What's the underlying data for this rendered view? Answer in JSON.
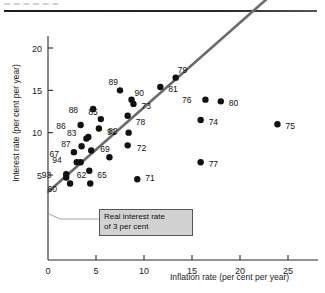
{
  "header": {
    "faint_text": "▬ ▬ ▬ ▬ ▬ ▬"
  },
  "annotation": {
    "line1": "Real interest rate",
    "line2": "of 3 per cent"
  },
  "chart_data": {
    "type": "scatter",
    "title": "",
    "xlabel": "Inflation rate (per cent per year)",
    "ylabel": "Interest rate (per cent per year)",
    "xlim": [
      0,
      28
    ],
    "ylim": [
      0,
      22.5
    ],
    "xticks": [
      0,
      5,
      10,
      15,
      20,
      25
    ],
    "yticks": [
      5,
      10,
      15,
      20
    ],
    "grid": false,
    "legend": "none",
    "reference_line": {
      "label": "Real interest rate of 3 per cent",
      "intercept": 3,
      "slope": 1,
      "color": "#6b6b6b",
      "x_start": 0,
      "x_end": 23.2
    },
    "points": [
      {
        "label": "60",
        "x": 2.3,
        "y": 4.0,
        "lx": -13,
        "ly": 6
      },
      {
        "label": "93",
        "x": 1.9,
        "y": 5.1,
        "lx": -15,
        "ly": 1
      },
      {
        "label": "93b",
        "x": 1.9,
        "y": 4.7,
        "lx": null,
        "ly": null
      },
      {
        "label": "94",
        "x": 3.0,
        "y": 6.5,
        "lx": -15,
        "ly": -2
      },
      {
        "label": "94b",
        "x": 3.4,
        "y": 6.5,
        "lx": null,
        "ly": null
      },
      {
        "label": "62",
        "x": 4.4,
        "y": 4.0,
        "lx": -4,
        "ly": -8
      },
      {
        "label": "65",
        "x": 4.3,
        "y": 5.5,
        "lx": 8,
        "ly": 4
      },
      {
        "label": "67",
        "x": 2.7,
        "y": 7.7,
        "lx": -15,
        "ly": 2
      },
      {
        "label": "87",
        "x": 3.5,
        "y": 8.4,
        "lx": -11,
        "ly": -2
      },
      {
        "label": "83",
        "x": 4.0,
        "y": 9.3,
        "lx": -10,
        "ly": -6
      },
      {
        "label": "83b",
        "x": 4.2,
        "y": 9.5,
        "lx": null,
        "ly": null
      },
      {
        "label": "69",
        "x": 4.5,
        "y": 7.9,
        "lx": 9,
        "ly": -1
      },
      {
        "label": "69b",
        "x": 6.4,
        "y": 7.1,
        "lx": null,
        "ly": null
      },
      {
        "label": "86",
        "x": 3.4,
        "y": 10.9,
        "lx": -15,
        "ly": 1
      },
      {
        "label": "88",
        "x": 4.7,
        "y": 12.8,
        "lx": -15,
        "ly": 1
      },
      {
        "label": "85",
        "x": 5.5,
        "y": 11.6,
        "lx": -3,
        "ly": -7
      },
      {
        "label": "91",
        "x": 5.3,
        "y": 10.5,
        "lx": 8,
        "ly": 4
      },
      {
        "label": "89",
        "x": 7.5,
        "y": 15.0,
        "lx": -2,
        "ly": -8
      },
      {
        "label": "82",
        "x": 8.4,
        "y": 10.0,
        "lx": -11,
        "ly": -2
      },
      {
        "label": "72",
        "x": 8.3,
        "y": 8.5,
        "lx": 9,
        "ly": 3
      },
      {
        "label": "78",
        "x": 8.3,
        "y": 12.0,
        "lx": 8,
        "ly": 6
      },
      {
        "label": "73",
        "x": 8.9,
        "y": 13.4,
        "lx": 8,
        "ly": 2
      },
      {
        "label": "90",
        "x": 8.7,
        "y": 13.9,
        "lx": 3,
        "ly": -7
      },
      {
        "label": "71",
        "x": 9.3,
        "y": 4.5,
        "lx": 8,
        "ly": -1
      },
      {
        "label": "81",
        "x": 11.7,
        "y": 15.4,
        "lx": 8,
        "ly": 2
      },
      {
        "label": "79",
        "x": 13.3,
        "y": 16.5,
        "lx": 2,
        "ly": -8
      },
      {
        "label": "76",
        "x": 16.4,
        "y": 13.9,
        "lx": -14,
        "ly": 0
      },
      {
        "label": "80",
        "x": 18.0,
        "y": 13.7,
        "lx": 8,
        "ly": 2
      },
      {
        "label": "74",
        "x": 15.9,
        "y": 11.5,
        "lx": 8,
        "ly": 2
      },
      {
        "label": "77",
        "x": 15.9,
        "y": 6.5,
        "lx": 8,
        "ly": 2
      },
      {
        "label": "75",
        "x": 23.9,
        "y": 11.0,
        "lx": 8,
        "ly": 2
      }
    ]
  }
}
